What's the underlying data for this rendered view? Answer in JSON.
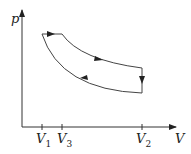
{
  "diagram": {
    "type": "p-V cycle",
    "y_axis_label": "p",
    "x_axis_label": "V",
    "ticks": [
      {
        "name": "V",
        "sub": "1"
      },
      {
        "name": "V",
        "sub": "3"
      },
      {
        "name": "V",
        "sub": "2"
      }
    ],
    "stroke_color": "#333333",
    "processes": [
      "isobaric expansion V1→V3 (top)",
      "expansion curve V3→V2",
      "isochoric pressure drop at V2",
      "compression curve V2→V1"
    ]
  }
}
